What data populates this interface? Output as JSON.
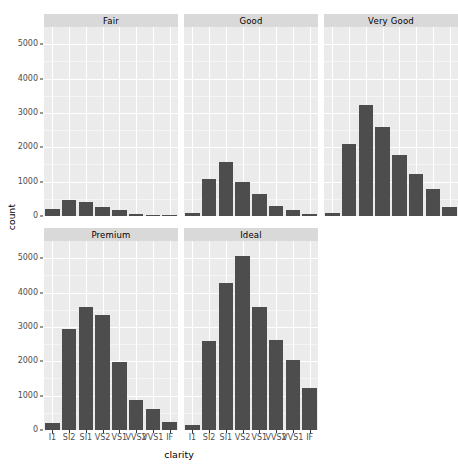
{
  "chart_data": {
    "type": "bar",
    "title": "",
    "subtitle": "",
    "xlabel": "clarity",
    "ylabel": "count",
    "ylim": [
      0,
      5500
    ],
    "grid": true,
    "legend": "none",
    "facet_by": "cut",
    "facet_layout": {
      "rows": 2,
      "cols": 3,
      "empty_cells": 1
    },
    "categories": [
      "I1",
      "SI2",
      "SI1",
      "VS2",
      "VS1",
      "VVS2",
      "VVS1",
      "IF"
    ],
    "y_ticks": [
      0,
      1000,
      2000,
      3000,
      4000,
      5000
    ],
    "y_tick_labels": [
      "0",
      "1000",
      "2000",
      "3000",
      "4000",
      "5000"
    ],
    "bar_color": "#4d4d4d",
    "panel_background": "#ebebeb",
    "strip_background": "#d9d9d9",
    "gridline_color": "#ffffff",
    "facets": [
      {
        "label": "Fair",
        "row": 0,
        "col": 0,
        "show_x_axis": false,
        "values": [
          210,
          466,
          408,
          261,
          170,
          69,
          17,
          9
        ]
      },
      {
        "label": "Good",
        "row": 0,
        "col": 1,
        "show_x_axis": false,
        "values": [
          96,
          1081,
          1560,
          978,
          648,
          286,
          186,
          71
        ]
      },
      {
        "label": "Very Good",
        "row": 0,
        "col": 2,
        "show_x_axis": false,
        "values": [
          84,
          2100,
          3240,
          2591,
          1775,
          1235,
          789,
          268
        ]
      },
      {
        "label": "Premium",
        "row": 1,
        "col": 0,
        "show_x_axis": true,
        "values": [
          205,
          2949,
          3575,
          3357,
          1989,
          870,
          616,
          230
        ]
      },
      {
        "label": "Ideal",
        "row": 1,
        "col": 1,
        "show_x_axis": true,
        "values": [
          146,
          2598,
          4282,
          5071,
          3589,
          2606,
          2047,
          1212
        ]
      }
    ],
    "series": [
      {
        "name": "Fair",
        "values": [
          210,
          466,
          408,
          261,
          170,
          69,
          17,
          9
        ]
      },
      {
        "name": "Good",
        "values": [
          96,
          1081,
          1560,
          978,
          648,
          286,
          186,
          71
        ]
      },
      {
        "name": "Very Good",
        "values": [
          84,
          2100,
          3240,
          2591,
          1775,
          1235,
          789,
          268
        ]
      },
      {
        "name": "Premium",
        "values": [
          205,
          2949,
          3575,
          3357,
          1989,
          870,
          616,
          230
        ]
      },
      {
        "name": "Ideal",
        "values": [
          146,
          2598,
          4282,
          5071,
          3589,
          2606,
          2047,
          1212
        ]
      }
    ]
  }
}
